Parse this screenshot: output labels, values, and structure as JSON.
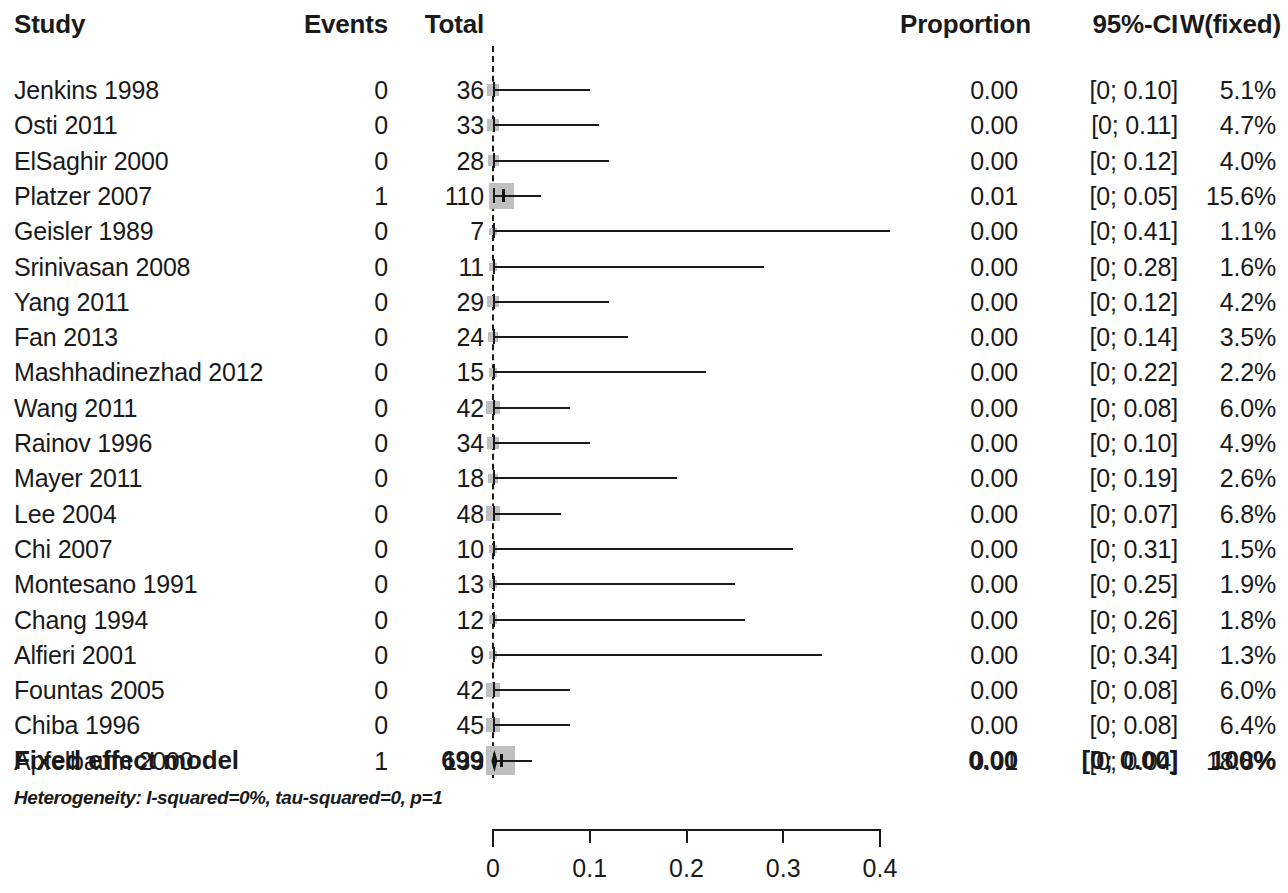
{
  "header": {
    "study": "Study",
    "events": "Events",
    "total": "Total",
    "proportion": "Proportion",
    "ci": "95%-CI",
    "weight": "W(fixed)"
  },
  "summary": {
    "label": "Fixed effect model",
    "events": "",
    "total": "699",
    "proportion": "0.00",
    "ci": "[0; 0.00]",
    "weight": "100%",
    "heterogeneity": "Heterogeneity: I-squared=0%, tau-squared=0, p=1"
  },
  "axis": {
    "ticks": [
      "0",
      "0.1",
      "0.2",
      "0.3",
      "0.4"
    ],
    "tick_values": [
      0,
      0.1,
      0.2,
      0.3,
      0.4
    ],
    "min": 0,
    "max": 0.4
  },
  "colors": {
    "ink": "#1a1a1a",
    "weight_box": "#bfbfbf",
    "background": "#ffffff"
  },
  "chart_data": {
    "type": "forest",
    "title": "",
    "xlabel": "",
    "ylabel": "",
    "xlim": [
      0,
      0.4
    ],
    "grid": false,
    "legend": "none",
    "effect_measure": "Proportion",
    "model": "Fixed effect model",
    "columns": [
      "Study",
      "Events",
      "Total",
      "Proportion",
      "95%-CI",
      "W(fixed)"
    ],
    "rows": [
      {
        "study": "Jenkins 1998",
        "events": "0",
        "total": "36",
        "proportion": "0.00",
        "ci": "[0; 0.10]",
        "weight": "5.1%",
        "est": 0.0,
        "lower": 0.0,
        "upper": 0.1,
        "wt": 5.1
      },
      {
        "study": "Osti 2011",
        "events": "0",
        "total": "33",
        "proportion": "0.00",
        "ci": "[0; 0.11]",
        "weight": "4.7%",
        "est": 0.0,
        "lower": 0.0,
        "upper": 0.11,
        "wt": 4.7
      },
      {
        "study": "ElSaghir 2000",
        "events": "0",
        "total": "28",
        "proportion": "0.00",
        "ci": "[0; 0.12]",
        "weight": "4.0%",
        "est": 0.0,
        "lower": 0.0,
        "upper": 0.12,
        "wt": 4.0
      },
      {
        "study": "Platzer 2007",
        "events": "1",
        "total": "110",
        "proportion": "0.01",
        "ci": "[0; 0.05]",
        "weight": "15.6%",
        "est": 0.009,
        "lower": 0.0,
        "upper": 0.05,
        "wt": 15.6
      },
      {
        "study": "Geisler 1989",
        "events": "0",
        "total": "7",
        "proportion": "0.00",
        "ci": "[0; 0.41]",
        "weight": "1.1%",
        "est": 0.0,
        "lower": 0.0,
        "upper": 0.41,
        "wt": 1.1
      },
      {
        "study": "Srinivasan 2008",
        "events": "0",
        "total": "11",
        "proportion": "0.00",
        "ci": "[0; 0.28]",
        "weight": "1.6%",
        "est": 0.0,
        "lower": 0.0,
        "upper": 0.28,
        "wt": 1.6
      },
      {
        "study": "Yang 2011",
        "events": "0",
        "total": "29",
        "proportion": "0.00",
        "ci": "[0; 0.12]",
        "weight": "4.2%",
        "est": 0.0,
        "lower": 0.0,
        "upper": 0.12,
        "wt": 4.2
      },
      {
        "study": "Fan 2013",
        "events": "0",
        "total": "24",
        "proportion": "0.00",
        "ci": "[0; 0.14]",
        "weight": "3.5%",
        "est": 0.0,
        "lower": 0.0,
        "upper": 0.14,
        "wt": 3.5
      },
      {
        "study": "Mashhadinezhad 2012",
        "events": "0",
        "total": "15",
        "proportion": "0.00",
        "ci": "[0; 0.22]",
        "weight": "2.2%",
        "est": 0.0,
        "lower": 0.0,
        "upper": 0.22,
        "wt": 2.2
      },
      {
        "study": "Wang 2011",
        "events": "0",
        "total": "42",
        "proportion": "0.00",
        "ci": "[0; 0.08]",
        "weight": "6.0%",
        "est": 0.0,
        "lower": 0.0,
        "upper": 0.08,
        "wt": 6.0
      },
      {
        "study": "Rainov 1996",
        "events": "0",
        "total": "34",
        "proportion": "0.00",
        "ci": "[0; 0.10]",
        "weight": "4.9%",
        "est": 0.0,
        "lower": 0.0,
        "upper": 0.1,
        "wt": 4.9
      },
      {
        "study": "Mayer 2011",
        "events": "0",
        "total": "18",
        "proportion": "0.00",
        "ci": "[0; 0.19]",
        "weight": "2.6%",
        "est": 0.0,
        "lower": 0.0,
        "upper": 0.19,
        "wt": 2.6
      },
      {
        "study": "Lee 2004",
        "events": "0",
        "total": "48",
        "proportion": "0.00",
        "ci": "[0; 0.07]",
        "weight": "6.8%",
        "est": 0.0,
        "lower": 0.0,
        "upper": 0.07,
        "wt": 6.8
      },
      {
        "study": "Chi 2007",
        "events": "0",
        "total": "10",
        "proportion": "0.00",
        "ci": "[0; 0.31]",
        "weight": "1.5%",
        "est": 0.0,
        "lower": 0.0,
        "upper": 0.31,
        "wt": 1.5
      },
      {
        "study": "Montesano 1991",
        "events": "0",
        "total": "13",
        "proportion": "0.00",
        "ci": "[0; 0.25]",
        "weight": "1.9%",
        "est": 0.0,
        "lower": 0.0,
        "upper": 0.25,
        "wt": 1.9
      },
      {
        "study": "Chang 1994",
        "events": "0",
        "total": "12",
        "proportion": "0.00",
        "ci": "[0; 0.26]",
        "weight": "1.8%",
        "est": 0.0,
        "lower": 0.0,
        "upper": 0.26,
        "wt": 1.8
      },
      {
        "study": "Alfieri 2001",
        "events": "0",
        "total": "9",
        "proportion": "0.00",
        "ci": "[0; 0.34]",
        "weight": "1.3%",
        "est": 0.0,
        "lower": 0.0,
        "upper": 0.34,
        "wt": 1.3
      },
      {
        "study": "Fountas 2005",
        "events": "0",
        "total": "42",
        "proportion": "0.00",
        "ci": "[0; 0.08]",
        "weight": "6.0%",
        "est": 0.0,
        "lower": 0.0,
        "upper": 0.08,
        "wt": 6.0
      },
      {
        "study": "Chiba 1996",
        "events": "0",
        "total": "45",
        "proportion": "0.00",
        "ci": "[0; 0.08]",
        "weight": "6.4%",
        "est": 0.0,
        "lower": 0.0,
        "upper": 0.08,
        "wt": 6.4
      },
      {
        "study": "Apfelbaum 2000",
        "events": "1",
        "total": "133",
        "proportion": "0.01",
        "ci": "[0; 0.04]",
        "weight": "18.8%",
        "est": 0.0075,
        "lower": 0.0,
        "upper": 0.04,
        "wt": 18.8
      }
    ],
    "overall": {
      "study": "Fixed effect model",
      "events": "",
      "total": "699",
      "proportion": "0.00",
      "ci": "[0; 0.00]",
      "weight": "100%",
      "est": 0.0015,
      "lower": 0.0,
      "upper": 0.006
    }
  }
}
